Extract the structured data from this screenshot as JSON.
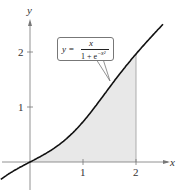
{
  "chart_data": {
    "type": "area",
    "title": "",
    "function_label": {
      "lhs": "y =",
      "numerator": "x",
      "denominator": "1 + e^{-x^2}"
    },
    "equation": "y = x / (1 + e^(-x^2))",
    "xlabel": "x",
    "ylabel": "y",
    "xlim": [
      -0.55,
      2.6
    ],
    "ylim": [
      -0.55,
      2.6
    ],
    "x_ticks": [
      1,
      2
    ],
    "x_tick_labels": [
      "1",
      "2"
    ],
    "y_ticks": [
      1,
      2
    ],
    "y_tick_labels": [
      "1",
      "2"
    ],
    "grid": false,
    "shaded_region": {
      "from_x": 0,
      "to_x": 2,
      "description": "area under curve between x=0 and x=2"
    },
    "series": [
      {
        "name": "y = x/(1+e^(-x^2))",
        "x": [
          -0.5,
          0,
          0.25,
          0.5,
          0.75,
          1.0,
          1.25,
          1.5,
          1.75,
          2.0,
          2.25,
          2.5
        ],
        "values": [
          -0.219,
          0,
          0.129,
          0.281,
          0.478,
          0.731,
          1.029,
          1.357,
          1.689,
          1.964,
          2.236,
          2.495
        ]
      }
    ],
    "colors": {
      "curve": "#111111",
      "shade": "#e6e6e6",
      "axis": "#666666"
    }
  },
  "labels": {
    "x_axis": "x",
    "y_axis": "y",
    "x_tick_1": "1",
    "x_tick_2": "2",
    "y_tick_1": "1",
    "y_tick_2": "2",
    "formula_lhs": "y =",
    "formula_num": "x",
    "formula_den": "1 + e"
  }
}
